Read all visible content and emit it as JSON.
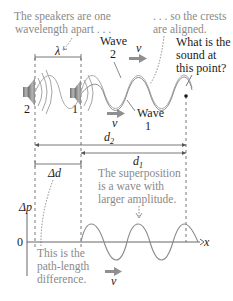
{
  "diagram": {
    "annotations": {
      "speakers_apart_line1": "The speakers are one",
      "speakers_apart_line2": "wavelength apart . . .",
      "crests_aligned_line1": ". . . so the crests",
      "crests_aligned_line2": "are aligned.",
      "question_line1": "What is the",
      "question_line2": "sound at",
      "question_line3": "this point?",
      "superposition_line1": "The superposition",
      "superposition_line2": "is a wave with",
      "superposition_line3": "larger amplitude.",
      "path_diff_line1": "This is the",
      "path_diff_line2": "path-length",
      "path_diff_line3": "difference."
    },
    "labels": {
      "wavelength": "λ",
      "wave2_word": "Wave",
      "wave2_num": "2",
      "wave1_word": "Wave",
      "wave1_num": "1",
      "speaker2": "2",
      "speaker1": "1",
      "velocity": "v",
      "d2": "d",
      "d2_sub": "2",
      "d1": "d",
      "d1_sub": "1",
      "delta_d": "Δd",
      "delta_p": "Δp",
      "zero": "0",
      "x_axis": "x"
    },
    "colors": {
      "caption": "#8a8a8a",
      "label": "#1a1a1a",
      "speaker": "#8c8c8c",
      "wave": "#9a9a9a",
      "arrow": "#8f8f8f"
    }
  }
}
